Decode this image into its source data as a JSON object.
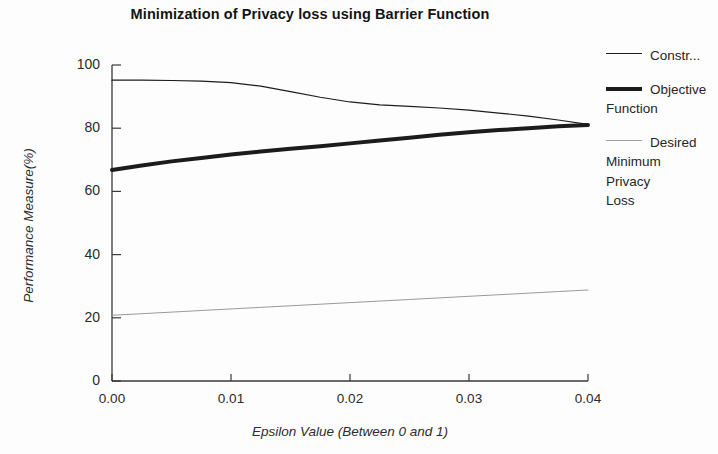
{
  "chart_data": {
    "type": "line",
    "title": "Minimization of Privacy loss using Barrier Function",
    "xlabel": "Epsilon Value (Between 0 and 1)",
    "ylabel": "Performance Measure(%)",
    "xlim": [
      0.0,
      0.04
    ],
    "ylim": [
      0,
      100
    ],
    "xticks": [
      "0.00",
      "0.01",
      "0.02",
      "0.03",
      "0.04"
    ],
    "xtick_values": [
      0.0,
      0.01,
      0.02,
      0.03,
      0.04
    ],
    "yticks": [
      "0",
      "20",
      "40",
      "60",
      "80",
      "100"
    ],
    "ytick_values": [
      0,
      20,
      40,
      60,
      80,
      100
    ],
    "grid": false,
    "legend_position": "right",
    "x": [
      0.0,
      0.0025,
      0.005,
      0.0075,
      0.01,
      0.0125,
      0.015,
      0.0175,
      0.02,
      0.0225,
      0.025,
      0.0275,
      0.03,
      0.0325,
      0.035,
      0.0375,
      0.04
    ],
    "series": [
      {
        "name": "Constr...",
        "full_name": "Constraint",
        "style": "thin-solid",
        "color": "#1c1c1c",
        "linewidth": 1.2,
        "values": [
          95.2,
          95.2,
          95.1,
          94.9,
          94.4,
          93.3,
          91.6,
          89.8,
          88.3,
          87.4,
          86.9,
          86.4,
          85.7,
          84.8,
          83.8,
          82.6,
          81.2
        ]
      },
      {
        "name": "Objective Function",
        "style": "thick-solid",
        "color": "#1c1c1c",
        "linewidth": 4.0,
        "values": [
          66.8,
          68.2,
          69.5,
          70.6,
          71.7,
          72.6,
          73.5,
          74.3,
          75.2,
          76.1,
          77.0,
          77.9,
          78.7,
          79.4,
          80.0,
          80.6,
          81.0
        ]
      },
      {
        "name": "Desired Minimum Privacy Loss",
        "style": "thin-light",
        "color": "#9a9a9a",
        "linewidth": 1.0,
        "values": [
          20.8,
          21.3,
          21.8,
          22.3,
          22.8,
          23.3,
          23.8,
          24.3,
          24.8,
          25.3,
          25.8,
          26.3,
          26.8,
          27.3,
          27.8,
          28.3,
          28.8
        ]
      }
    ]
  },
  "legend": {
    "entries": [
      {
        "label": "Constr...",
        "swatch": "thin-line-swatch"
      },
      {
        "label": "Objective\nFunction",
        "swatch": "thick-line-swatch"
      },
      {
        "label": "Desired\nMinimum\nPrivacy\nLoss",
        "swatch": "light-line-swatch"
      }
    ]
  },
  "axes": {
    "axis_color": "#3a3a3a",
    "plot_left_px": 112,
    "plot_right_px": 588,
    "plot_top_px": 65,
    "plot_bottom_px": 381
  }
}
